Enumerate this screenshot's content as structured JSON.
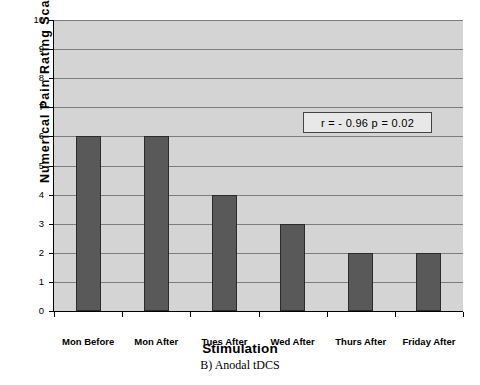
{
  "chart_data": {
    "type": "bar",
    "title": "",
    "xlabel": "Stimulation",
    "ylabel": "Numerical Pain Rating Scale",
    "categories": [
      "Mon Before",
      "Mon After",
      "Tues After",
      "Wed After",
      "Thurs After",
      "Friday After"
    ],
    "values": [
      6,
      6,
      4,
      3,
      2,
      2
    ],
    "ylim": [
      0,
      10
    ],
    "ytick_labels": [
      "0",
      "1",
      "2",
      "3",
      "4",
      "5",
      "6",
      "7",
      "8",
      "9",
      "10"
    ],
    "grid": true,
    "legend": "none",
    "annotations": [
      {
        "text": "r = - 0.96   p = 0.02"
      }
    ],
    "caption": "B) Anodal tDCS",
    "colors": {
      "bar_fill": "#595959",
      "bar_border": "#2b2b2b",
      "plot_background": "#d4d4d4",
      "gridline": "#7d7d7d",
      "axis": "#000000",
      "page_background": "#ffffff"
    }
  }
}
